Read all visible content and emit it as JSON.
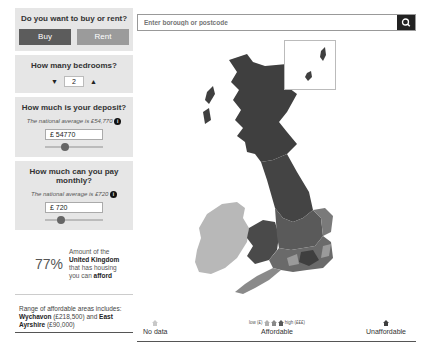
{
  "sidebar": {
    "buy_rent": {
      "title": "Do you want to buy or rent?",
      "buy_label": "Buy",
      "rent_label": "Rent",
      "selected": "Buy"
    },
    "bedrooms": {
      "title": "How many bedrooms?",
      "value": "2",
      "decrement_icon": "▼",
      "increment_icon": "▲"
    },
    "deposit": {
      "title": "How much is your deposit?",
      "note": "The national average is £54,770",
      "info_icon": "i",
      "value": "£ 54770",
      "slider_percent": 35
    },
    "monthly": {
      "title": "How much can you pay monthly?",
      "note": "The national average is £720",
      "info_icon": "i",
      "value": "£ 720",
      "slider_percent": 28
    },
    "stat": {
      "percent": "77%",
      "line1": "Amount of the",
      "region": "United Kingdom",
      "line3": "that has housing",
      "line4_prefix": "you can",
      "line4_bold": "afford"
    },
    "range": {
      "intro": "Range of affordable areas includes:",
      "area1": "Wychavon",
      "area1_value": "(£218,500) and",
      "area2": "East Ayrshire",
      "area2_value": "(£90,000)"
    }
  },
  "search": {
    "placeholder": "Enter borough or postcode",
    "value": "",
    "button_icon": "search-icon"
  },
  "map": {
    "colors": {
      "unaffordable": "#3f3f3f",
      "afford_high": "#5a5a5a",
      "afford_mid": "#7a7a7a",
      "afford_low": "#9a9a9a",
      "no_data": "#b5b5b5",
      "ireland": "#b8b8b8"
    }
  },
  "legend": {
    "no_data": "No data",
    "affordable": "Affordable",
    "unaffordable": "Unaffordable",
    "scale_low": "low (£)",
    "scale_high": "high (£££)"
  }
}
